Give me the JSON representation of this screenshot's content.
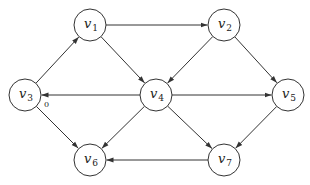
{
  "diagram": {
    "type": "directed-graph",
    "radius": 16,
    "stroke_color": "#333333",
    "nodes": [
      {
        "id": "v1",
        "base": "v",
        "sub": "1",
        "x": 90,
        "y": 25
      },
      {
        "id": "v2",
        "base": "v",
        "sub": "2",
        "x": 224,
        "y": 25
      },
      {
        "id": "v3",
        "base": "v",
        "sub": "3",
        "x": 25,
        "y": 95
      },
      {
        "id": "v4",
        "base": "v",
        "sub": "4",
        "x": 156,
        "y": 95
      },
      {
        "id": "v5",
        "base": "v",
        "sub": "5",
        "x": 288,
        "y": 95
      },
      {
        "id": "v6",
        "base": "v",
        "sub": "6",
        "x": 90,
        "y": 160
      },
      {
        "id": "v7",
        "base": "v",
        "sub": "7",
        "x": 224,
        "y": 160
      }
    ],
    "edges": [
      {
        "from": "v1",
        "to": "v2"
      },
      {
        "from": "v1",
        "to": "v4"
      },
      {
        "from": "v3",
        "to": "v1"
      },
      {
        "from": "v2",
        "to": "v4"
      },
      {
        "from": "v2",
        "to": "v5"
      },
      {
        "from": "v4",
        "to": "v3"
      },
      {
        "from": "v4",
        "to": "v5"
      },
      {
        "from": "v4",
        "to": "v6"
      },
      {
        "from": "v4",
        "to": "v7"
      },
      {
        "from": "v3",
        "to": "v6"
      },
      {
        "from": "v5",
        "to": "v7"
      },
      {
        "from": "v7",
        "to": "v6"
      }
    ],
    "annotations": [
      {
        "text": "0",
        "x": 44,
        "y": 107,
        "near": "v3"
      }
    ]
  }
}
